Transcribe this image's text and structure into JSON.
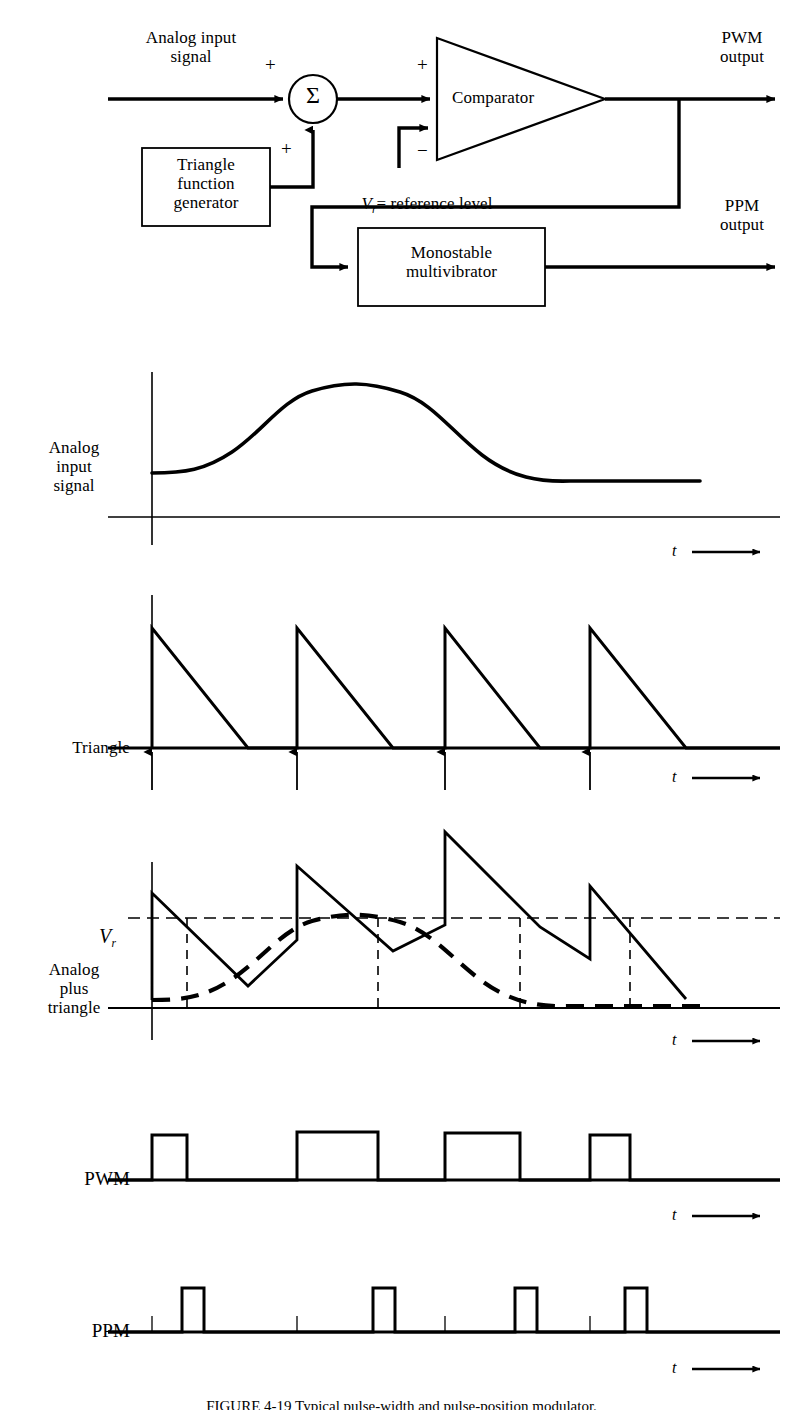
{
  "figure": {
    "title_label": "PWM and PPM generation block diagram and waveforms",
    "caption": "FIGURE 4-19 Typical pulse-width and pulse-position modulator."
  },
  "block_diagram": {
    "input_label": "Analog input\nsignal",
    "summer_symbol": "Σ",
    "summer_plus_top": "+",
    "summer_plus_bottom": "+",
    "triangle_generator_label": "Triangle\nfunction\ngenerator",
    "comparator_label": "Comparator",
    "comparator_plus": "+",
    "comparator_minus": "−",
    "reference_label_v": "V",
    "reference_label_sub": "r",
    "reference_label_rest": "= reference level",
    "monostable_label": "Monostable\nmultivibrator",
    "pwm_output_label": "PWM\noutput",
    "ppm_output_label": "PPM\noutput"
  },
  "waveforms": [
    {
      "id": "analog-input",
      "label": "Analog\ninput\nsignal",
      "time_axis_label": "t",
      "description": "Smooth raised-cosine analog message signal"
    },
    {
      "id": "triangle",
      "label": "Triangle",
      "time_axis_label": "t",
      "description": "Sawtooth (triangle) sampling waveform, 4 cycles, sharp rise then linear fall"
    },
    {
      "id": "analog-plus-triangle",
      "label": "Analog\nplus\ntriangle",
      "time_axis_label": "t",
      "reference_label_v": "V",
      "reference_label_sub": "r",
      "description": "Sawtooth riding on the dashed analog signal, crossing reference level Vr"
    },
    {
      "id": "pwm",
      "label": "PWM",
      "time_axis_label": "t",
      "description": "Pulse-width modulated output, 4 pulses of varying width"
    },
    {
      "id": "ppm",
      "label": "PPM",
      "time_axis_label": "t",
      "description": "Pulse-position modulated output, 4 narrow pulses at varying positions"
    }
  ],
  "chart_data": {
    "type": "line",
    "xlabel": "t",
    "ylabel": "",
    "grid": false,
    "legend": "none",
    "panels": [
      {
        "name": "Analog input signal",
        "type": "line",
        "x": [
          152,
          190,
          230,
          270,
          310,
          350,
          390,
          430,
          470,
          510,
          550,
          590,
          630,
          670,
          710,
          750,
          770
        ],
        "y_normalized": [
          0.3,
          0.31,
          0.36,
          0.47,
          0.62,
          0.78,
          0.91,
          0.98,
          1.0,
          0.97,
          0.88,
          0.74,
          0.58,
          0.44,
          0.34,
          0.29,
          0.29
        ],
        "baseline": "zero axis drawn at bottom of panel"
      },
      {
        "name": "Triangle",
        "type": "sawtooth",
        "cycles": 4,
        "rise_positions": [
          152,
          297,
          445,
          590
        ],
        "fall_end_positions": [
          248,
          393,
          540,
          686
        ],
        "peak_normalized": 1.0,
        "arrow_markers": [
          152,
          297,
          445,
          590
        ]
      },
      {
        "name": "Analog plus triangle",
        "type": "sawtooth-plus-analog",
        "cycles": 4,
        "rise_positions": [
          152,
          297,
          445,
          590
        ],
        "fall_end_positions": [
          248,
          393,
          540,
          686
        ],
        "reference_level_label": "Vr",
        "reference_level_normalized": 0.62,
        "crossing_positions": [
          187,
          378,
          520,
          630
        ],
        "analog_dashed": true
      },
      {
        "name": "PWM",
        "type": "pulse",
        "pulse_starts": [
          152,
          297,
          445,
          590
        ],
        "pulse_ends": [
          187,
          378,
          520,
          630
        ],
        "pulse_widths": [
          35,
          81,
          75,
          40
        ],
        "amplitude_normalized": 1.0
      },
      {
        "name": "PPM",
        "type": "pulse",
        "pulse_starts": [
          182,
          373,
          515,
          625
        ],
        "pulse_ends": [
          204,
          395,
          537,
          647
        ],
        "pulse_width": 22,
        "tick_positions": [
          152,
          297,
          445,
          590
        ],
        "amplitude_normalized": 1.0
      }
    ]
  }
}
